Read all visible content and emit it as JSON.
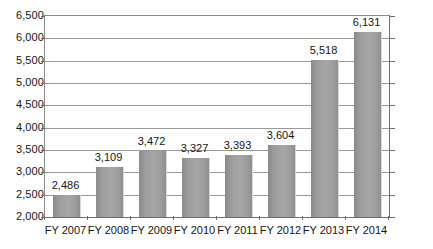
{
  "chart_data": {
    "type": "bar",
    "title": "",
    "subtitle": "",
    "xlabel": "",
    "ylabel": "",
    "categories": [
      "FY 2007",
      "FY 2008",
      "FY 2009",
      "FY 2010",
      "FY 2011",
      "FY 2012",
      "FY 2013",
      "FY 2014"
    ],
    "values": [
      2486,
      3109,
      3472,
      3327,
      3393,
      3604,
      5518,
      6131
    ],
    "data_labels": [
      "2,486",
      "3,109",
      "3,472",
      "3,327",
      "3,393",
      "3,604",
      "5,518",
      "6,131"
    ],
    "ylim": [
      2000,
      6500
    ],
    "ytick_step": 500,
    "ytick_labels": [
      "6,500",
      "6,000",
      "5,500",
      "5,000",
      "4,500",
      "4,000",
      "3,500",
      "3,000",
      "2,500",
      "2,000"
    ],
    "ytick_values": [
      6500,
      6000,
      5500,
      5000,
      4500,
      4000,
      3500,
      3000,
      2500,
      2000
    ],
    "grid": true,
    "legend": "none",
    "series": [
      {
        "name": "",
        "values": [
          2486,
          3109,
          3472,
          3327,
          3393,
          3604,
          5518,
          6131
        ]
      }
    ],
    "colors": {
      "bar_fill": "#a0a0a0",
      "bar_edge_light": "#d8d8d8",
      "gridline": "#9a9a9a",
      "axis": "#6f6f6f",
      "text": "#161616",
      "background": "#ffffff"
    }
  }
}
